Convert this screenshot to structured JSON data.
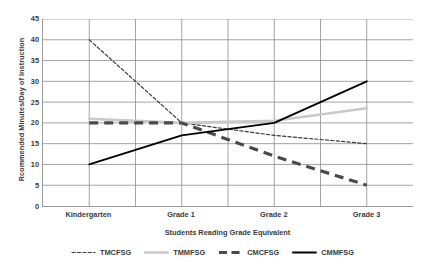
{
  "chart_data": {
    "type": "line",
    "title": "",
    "xlabel": "Students Reading Grade Equivalent",
    "ylabel": "Rcommended Minutes/Day  of Instruction",
    "categories": [
      "Kindergarten",
      "Grade 1",
      "Grade 2",
      "Grade 3"
    ],
    "ylim": [
      0,
      45
    ],
    "yticks": [
      0,
      5,
      10,
      15,
      20,
      25,
      30,
      35,
      40,
      45
    ],
    "grid": "both",
    "legend_position": "bottom",
    "series": [
      {
        "name": "TMCFSG",
        "values": [
          40,
          20,
          17,
          15
        ],
        "color": "#3b3b3b",
        "style": "fine-dashed",
        "width": 1.2
      },
      {
        "name": "TMMFSG",
        "values": [
          21,
          20,
          20.5,
          23.5
        ],
        "color": "#c9c9c9",
        "style": "solid",
        "width": 2.6
      },
      {
        "name": "CMCFSG",
        "values": [
          20,
          20,
          12,
          5
        ],
        "color": "#4a4a4a",
        "style": "thick-dashed",
        "width": 3.2
      },
      {
        "name": "CMMFSG",
        "values": [
          10,
          17,
          20,
          30
        ],
        "color": "#000000",
        "style": "solid",
        "width": 1.9
      }
    ]
  },
  "legend": {
    "entries": [
      {
        "label": "TMCFSG"
      },
      {
        "label": "TMMFSG"
      },
      {
        "label": "CMCFSG"
      },
      {
        "label": "CMMFSG"
      }
    ]
  }
}
